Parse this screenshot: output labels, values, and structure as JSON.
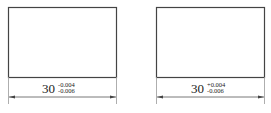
{
  "figures": [
    {
      "id": "left",
      "dimension": {
        "nominal": "30",
        "upper_tol": "-0.004",
        "lower_tol": "-0.006"
      }
    },
    {
      "id": "right",
      "dimension": {
        "nominal": "30",
        "upper_tol": "+0.004",
        "lower_tol": "-0.006"
      }
    }
  ],
  "colors": {
    "line": "#444444",
    "extension": "#888888",
    "text": "#222222"
  }
}
